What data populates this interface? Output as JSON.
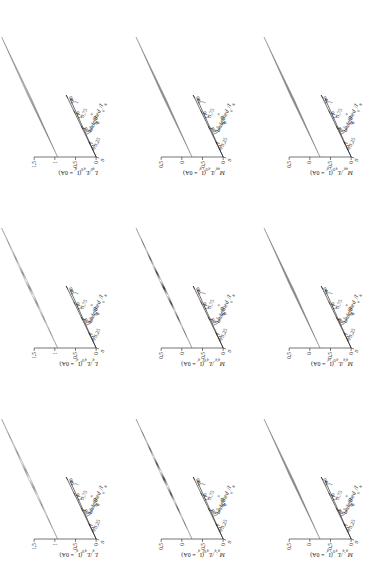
{
  "figure": {
    "type": "3x3-surface-plot-matrix",
    "orientation_deg": -90,
    "background": "#ffffff",
    "axis_color": "#000000"
  },
  "axes_common": {
    "x": {
      "label_symbol": "θ",
      "label_text": "θ in °",
      "ticks": [
        "90",
        "180",
        "270",
        "360"
      ],
      "min": 0,
      "max": 360
    },
    "y": {
      "label_text": "I",
      "label_sub": "q'",
      "label_den": "I",
      "label_den_sub": "N",
      "ticks": [
        "0",
        "0,25",
        "0,5",
        "0,75",
        "1"
      ],
      "min": 0,
      "max": 1
    }
  },
  "panels": [
    {
      "id": "p11",
      "row": 0,
      "col": 0,
      "zlabel_num": "L",
      "zlabel_num_sub": "q'",
      "zlabel_den": "L",
      "zlabel_den_sub": "q'0",
      "zlabel_cond": "(I",
      "zlabel_cond_sub": "q'",
      "zlabel_cond_tail": " = 0A)",
      "zticks": [
        "0",
        "0,5",
        "1",
        "1,5"
      ],
      "zmin": 0,
      "zmax": 1.5,
      "surface": "ripple-light",
      "ripples": 7,
      "shade_low": "#ffffff",
      "shade_high": "#9a9a9a"
    },
    {
      "id": "p12",
      "row": 0,
      "col": 1,
      "zlabel_num": "L",
      "zlabel_num_sub": "q'",
      "zlabel_den": "L",
      "zlabel_den_sub": "q'0",
      "zlabel_cond": "(I",
      "zlabel_cond_sub": "q'",
      "zlabel_cond_tail": " = 0A)",
      "zticks": [
        "0",
        "0,5",
        "1",
        "1,5"
      ],
      "zmin": 0,
      "zmax": 1.5,
      "surface": "ripple-mid",
      "ripples": 8,
      "shade_low": "#ffffff",
      "shade_high": "#8c8c8c"
    },
    {
      "id": "p13",
      "row": 0,
      "col": 2,
      "zlabel_num": "L",
      "zlabel_num_sub": "q0",
      "zlabel_den": "L",
      "zlabel_den_sub": "q'0",
      "zlabel_cond": "(I",
      "zlabel_cond_sub": "q'",
      "zlabel_cond_tail": " = 0A)",
      "zticks": [
        "0",
        "0,5",
        "1",
        "1,5"
      ],
      "zmin": 0,
      "zmax": 1.5,
      "surface": "noisy-flat",
      "ripples": 0,
      "shade_low": "#b8b8b8",
      "shade_high": "#7a7a7a"
    },
    {
      "id": "p21",
      "row": 1,
      "col": 0,
      "zlabel_num": "M",
      "zlabel_num_sub": "q''q'",
      "zlabel_den": "L",
      "zlabel_den_sub": "q'0",
      "zlabel_cond": "(I",
      "zlabel_cond_sub": "q'",
      "zlabel_cond_tail": " = 0A)",
      "zticks": [
        "0",
        "-0,5",
        "0",
        "0,5"
      ],
      "zmin": -0.5,
      "zmax": 0.5,
      "surface": "ripple-dark",
      "ripples": 8,
      "shade_low": "#ffffff",
      "shade_high": "#3a3a3a"
    },
    {
      "id": "p22",
      "row": 1,
      "col": 1,
      "zlabel_num": "M",
      "zlabel_num_sub": "q'q''",
      "zlabel_den": "L",
      "zlabel_den_sub": "q'0",
      "zlabel_cond": "(I",
      "zlabel_cond_sub": "q'",
      "zlabel_cond_tail": " = 0A)",
      "zticks": [
        "0",
        "-0,5",
        "0",
        "0,5"
      ],
      "zmin": -0.5,
      "zmax": 0.5,
      "surface": "ripple-dark",
      "ripples": 8,
      "shade_low": "#ffffff",
      "shade_high": "#2e2e2e"
    },
    {
      "id": "p23",
      "row": 1,
      "col": 2,
      "zlabel_num": "M",
      "zlabel_num_sub": "qq'",
      "zlabel_den": "L",
      "zlabel_den_sub": "q'0",
      "zlabel_cond": "(I",
      "zlabel_cond_sub": "q'",
      "zlabel_cond_tail": " = 0A)",
      "zticks": [
        "0",
        "-0,5",
        "0",
        "0,5"
      ],
      "zmin": -0.5,
      "zmax": 0.5,
      "surface": "flat-grey",
      "ripples": 0,
      "shade_low": "#9d9d9d",
      "shade_high": "#8a8a8a"
    },
    {
      "id": "p31",
      "row": 2,
      "col": 0,
      "zlabel_num": "M",
      "zlabel_num_sub": "q''q",
      "zlabel_den": "L",
      "zlabel_den_sub": "q'0",
      "zlabel_cond": "(I",
      "zlabel_cond_sub": "q'",
      "zlabel_cond_tail": " = 0A)",
      "zticks": [
        "0",
        "-0,5",
        "0",
        "0,5"
      ],
      "zmin": -0.5,
      "zmax": 0.5,
      "surface": "flat-grey",
      "ripples": 0,
      "shade_low": "#9d9d9d",
      "shade_high": "#868686"
    },
    {
      "id": "p32",
      "row": 2,
      "col": 1,
      "zlabel_num": "M",
      "zlabel_num_sub": "q'q",
      "zlabel_den": "L",
      "zlabel_den_sub": "q'0",
      "zlabel_cond": "(I",
      "zlabel_cond_sub": "q'",
      "zlabel_cond_tail": " = 0A)",
      "zticks": [
        "0",
        "-0,5",
        "0",
        "0,5"
      ],
      "zmin": -0.5,
      "zmax": 0.5,
      "surface": "flat-grey",
      "ripples": 0,
      "shade_low": "#9b9b9b",
      "shade_high": "#858585"
    },
    {
      "id": "p33",
      "row": 2,
      "col": 2,
      "zlabel_num": "M",
      "zlabel_num_sub": "qq''",
      "zlabel_den": "L",
      "zlabel_den_sub": "q'0",
      "zlabel_cond": "(I",
      "zlabel_cond_sub": "q'",
      "zlabel_cond_tail": " = 0A)",
      "zticks": [
        "0",
        "-0,5",
        "0",
        "0,5"
      ],
      "zmin": -0.5,
      "zmax": 0.5,
      "surface": "flat-grey",
      "ripples": 0,
      "shade_low": "#9d9d9d",
      "shade_high": "#838383"
    }
  ],
  "chart_data": {
    "type": "surface",
    "title": "",
    "xlabel": "θ in °",
    "ylabel": "I_q' / I_N",
    "grid": false,
    "legend": "none",
    "panel_count": 9,
    "x": [
      0,
      90,
      180,
      270,
      360
    ],
    "y": [
      0,
      0.25,
      0.5,
      0.75,
      1
    ],
    "panels": [
      {
        "name": "L_q'/L_q'0(I_q'=0A)",
        "zlim": [
          0,
          1.5
        ],
        "description": "strong periodic ripple in theta, amplitude decaying with I_q'/I_N",
        "z_mean": 0.95,
        "z_ripple_amplitude": 0.45,
        "periods": 4
      },
      {
        "name": "L_q'/L_q'0(I_q'=0A)",
        "zlim": [
          0,
          1.5
        ],
        "description": "periodic ripple, moderate amplitude",
        "z_mean": 0.9,
        "z_ripple_amplitude": 0.35,
        "periods": 4
      },
      {
        "name": "L_q0/L_q'0(I_q'=0A)",
        "zlim": [
          0,
          1.5
        ],
        "description": "near-flat noisy surface",
        "z_mean": 1.0,
        "z_ripple_amplitude": 0.05,
        "periods": 0
      },
      {
        "name": "M_q''q'/L_q'0(I_q'=0A)",
        "zlim": [
          -0.5,
          0.5
        ],
        "description": "high-contrast periodic ripple about zero",
        "z_mean": 0.0,
        "z_ripple_amplitude": 0.35,
        "periods": 4
      },
      {
        "name": "M_q'q''/L_q'0(I_q'=0A)",
        "zlim": [
          -0.5,
          0.5
        ],
        "description": "high-contrast periodic ripple about zero",
        "z_mean": 0.0,
        "z_ripple_amplitude": 0.35,
        "periods": 4
      },
      {
        "name": "M_qq'/L_q'0(I_q'=0A)",
        "zlim": [
          -0.5,
          0.5
        ],
        "description": "flat near zero",
        "z_mean": 0.0,
        "z_ripple_amplitude": 0.02,
        "periods": 0
      },
      {
        "name": "M_q''q/L_q'0(I_q'=0A)",
        "zlim": [
          -0.5,
          0.5
        ],
        "description": "flat near zero",
        "z_mean": 0.0,
        "z_ripple_amplitude": 0.02,
        "periods": 0
      },
      {
        "name": "M_q'q/L_q'0(I_q'=0A)",
        "zlim": [
          -0.5,
          0.5
        ],
        "description": "flat near zero",
        "z_mean": 0.0,
        "z_ripple_amplitude": 0.02,
        "periods": 0
      },
      {
        "name": "M_qq''/L_q'0(I_q'=0A)",
        "zlim": [
          -0.5,
          0.5
        ],
        "description": "flat near zero",
        "z_mean": 0.0,
        "z_ripple_amplitude": 0.02,
        "periods": 0
      }
    ]
  }
}
